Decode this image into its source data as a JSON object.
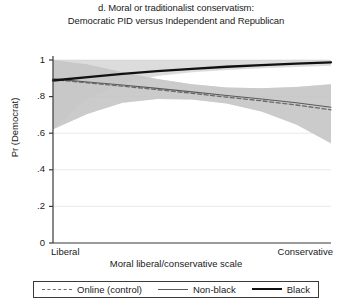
{
  "chart_data": {
    "type": "line",
    "title": "d. Moral or traditionalist conservatism:",
    "subtitle": "Democratic PID versus Independent and Republican",
    "xlabel": "Moral liberal/conservative scale",
    "ylabel": "Pr (Democrat)",
    "xlim": [
      0,
      1
    ],
    "ylim": [
      0,
      1
    ],
    "grid": true,
    "legend_position": "bottom",
    "xticks": [
      0,
      1
    ],
    "xticklabels": [
      "Liberal",
      "Conservative"
    ],
    "yticks": [
      0,
      0.2,
      0.4,
      0.6,
      0.8,
      1
    ],
    "yticklabels": [
      "0",
      ".2",
      ".4",
      ".6",
      ".8",
      "1"
    ],
    "x": [
      0,
      0.125,
      0.25,
      0.375,
      0.5,
      0.625,
      0.75,
      0.875,
      1
    ],
    "series": [
      {
        "name": "Online (control)",
        "style": "dashed",
        "color": "#6a6a6a",
        "values": [
          0.893,
          0.875,
          0.857,
          0.838,
          0.818,
          0.797,
          0.777,
          0.754,
          0.728
        ],
        "ci_lower": [
          0.622,
          0.706,
          0.766,
          0.787,
          0.784,
          0.762,
          0.718,
          0.647,
          0.545
        ],
        "ci_upper": [
          1.0,
          0.975,
          0.933,
          0.896,
          0.868,
          0.85,
          0.845,
          0.852,
          0.868
        ]
      },
      {
        "name": "Non-black",
        "style": "solid-thin",
        "color": "#5a5a5a",
        "values": [
          0.897,
          0.88,
          0.863,
          0.845,
          0.826,
          0.806,
          0.787,
          0.766,
          0.742
        ],
        "ci_lower": [
          0.622,
          0.706,
          0.766,
          0.787,
          0.784,
          0.762,
          0.718,
          0.647,
          0.545
        ],
        "ci_upper": [
          1.0,
          0.975,
          0.933,
          0.896,
          0.868,
          0.85,
          0.845,
          0.852,
          0.868
        ]
      },
      {
        "name": "Black",
        "style": "solid-thick",
        "color": "#111111",
        "values": [
          0.888,
          0.907,
          0.924,
          0.939,
          0.952,
          0.963,
          0.972,
          0.98,
          0.987
        ],
        "ci_lower": [
          0.622,
          0.79,
          0.872,
          0.912,
          0.933,
          0.946,
          0.955,
          0.962,
          0.968
        ],
        "ci_upper": [
          1.0,
          1.0,
          1.0,
          1.0,
          1.0,
          1.0,
          1.0,
          1.0,
          1.0
        ]
      }
    ],
    "band_color": "#c6c6c6",
    "axis_color": "#3a3a3a",
    "grid_color": "#e9e9e9"
  },
  "legend": {
    "items": [
      {
        "label": "Online (control)",
        "swatch": "dashed-line-swatch"
      },
      {
        "label": "Non-black",
        "swatch": "thin-line-swatch"
      },
      {
        "label": "Black",
        "swatch": "thick-line-swatch"
      }
    ]
  }
}
